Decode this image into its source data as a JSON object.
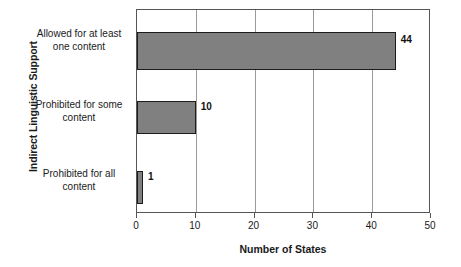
{
  "chart_data": {
    "type": "bar",
    "orientation": "horizontal",
    "title": "",
    "xlabel": "Number of States",
    "ylabel": "Indirect Linguistic Support",
    "categories": [
      "Allowed for at least one content",
      "Prohibited for some content",
      "Prohibited for all content"
    ],
    "category_lines": [
      [
        "Allowed for at least",
        "one content"
      ],
      [
        "Prohibited for some",
        "content"
      ],
      [
        "Prohibited for all",
        "content"
      ]
    ],
    "values": [
      44,
      10,
      1
    ],
    "value_labels": [
      "44",
      "10",
      "1"
    ],
    "xlim": [
      0,
      50
    ],
    "xticks": [
      0,
      10,
      20,
      30,
      40,
      50
    ],
    "xtick_labels": [
      "0",
      "10",
      "20",
      "30",
      "40",
      "50"
    ],
    "grid": "vertical",
    "legend": "none",
    "colors": {
      "bar_fill": "#808080",
      "bar_border": "#1c1c1c",
      "gridline": "#9a9a9a",
      "axis": "#555555",
      "text": "#1a1a1a",
      "background": "#ffffff"
    }
  }
}
